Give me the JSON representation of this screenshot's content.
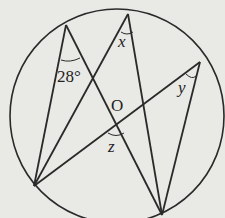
{
  "diagram": {
    "labels": {
      "angle_a": "28°",
      "x": "x",
      "y": "y",
      "z": "z",
      "center": "O"
    },
    "colors": {
      "stroke": "#2a2a2a",
      "background": "#e9e9e6"
    }
  }
}
